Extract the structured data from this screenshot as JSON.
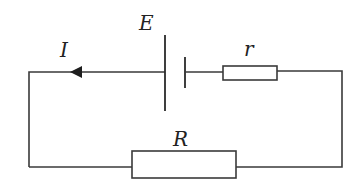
{
  "diagram": {
    "type": "circuit",
    "labels": {
      "emf": "E",
      "current": "I",
      "internal_resistance": "r",
      "external_resistance": "R"
    },
    "components": [
      {
        "id": "battery",
        "label": "E",
        "kind": "cell"
      },
      {
        "id": "internal_resistor",
        "label": "r",
        "kind": "resistor"
      },
      {
        "id": "external_resistor",
        "label": "R",
        "kind": "resistor"
      },
      {
        "id": "current_arrow",
        "label": "I",
        "kind": "arrow",
        "direction": "left"
      }
    ],
    "colors": {
      "line": "#3a3a3a",
      "background": "#ffffff"
    }
  }
}
